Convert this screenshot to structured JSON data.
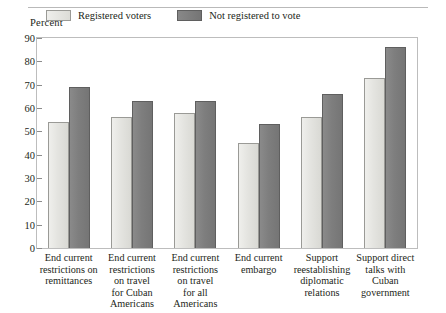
{
  "chart_data": {
    "type": "bar",
    "title": "",
    "subtitle": "",
    "xlabel": "",
    "ylabel": "Percent",
    "ylim": [
      0,
      90
    ],
    "yticks": [
      0,
      10,
      20,
      30,
      40,
      50,
      60,
      70,
      80,
      90
    ],
    "grid": false,
    "legend_position": "top-inside",
    "categories": [
      "End current restrictions on remittances",
      "End current restrictions on travel for Cuban Americans",
      "End current restrictions on travel for all Americans",
      "End current embargo",
      "Support reestablishing diplomatic relations",
      "Support direct talks with Cuban government"
    ],
    "category_lines": [
      [
        "End current",
        "restrictions on",
        "remittances"
      ],
      [
        "End current",
        "restrictions",
        "on travel",
        "for Cuban",
        "Americans"
      ],
      [
        "End current",
        "restrictions",
        "on travel",
        "for all",
        "Americans"
      ],
      [
        "End current",
        "embargo"
      ],
      [
        "Support",
        "reestablishing",
        "diplomatic",
        "relations"
      ],
      [
        "Support direct",
        "talks with",
        "Cuban",
        "government"
      ]
    ],
    "series": [
      {
        "name": "Registered voters",
        "color": "#e4e4e0",
        "values": [
          54,
          56,
          58,
          45,
          56,
          73
        ]
      },
      {
        "name": "Not registered to vote",
        "color": "#7e7e7e",
        "values": [
          69,
          63,
          63,
          53,
          66,
          86
        ]
      }
    ]
  },
  "legend": {
    "items": [
      {
        "label": "Registered voters"
      },
      {
        "label": "Not registered to vote"
      }
    ]
  }
}
